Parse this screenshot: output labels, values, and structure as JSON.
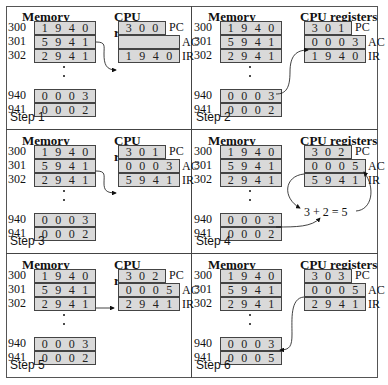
{
  "headers": {
    "memory": "Memory",
    "cpu": "CPU registers"
  },
  "register_labels": {
    "pc": "PC",
    "ac": "AC",
    "ir": "IR"
  },
  "addresses": [
    "300",
    "301",
    "302",
    "940",
    "941"
  ],
  "steps": [
    {
      "label": "Step 1",
      "memory": [
        "1 9 4 0",
        "5 9 4 1",
        "2 9 4 1",
        "0 0 0 3",
        "0 0 0 2"
      ],
      "pc": "3 0 0",
      "ac": "",
      "ir": "1 9 4 0"
    },
    {
      "label": "Step 2",
      "memory": [
        "1 9 4 0",
        "5 9 4 1",
        "2 9 4 1",
        "0 0 0 3",
        "0 0 0 2"
      ],
      "pc": "3 0 1",
      "ac": "0 0 0 3",
      "ir": "1 9 4 0"
    },
    {
      "label": "Step 3",
      "memory": [
        "1 9 4 0",
        "5 9 4 1",
        "2 9 4 1",
        "0 0 0 3",
        "0 0 0 2"
      ],
      "pc": "3 0 1",
      "ac": "0 0 0 3",
      "ir": "5 9 4 1"
    },
    {
      "label": "Step 4",
      "memory": [
        "1 9 4 0",
        "5 9 4 1",
        "2 9 4 1",
        "0 0 0 3",
        "0 0 0 2"
      ],
      "pc": "3 0 2",
      "ac": "0 0 0 5",
      "ir": "5 9 4 1",
      "annotation": "3 + 2 = 5"
    },
    {
      "label": "Step 5",
      "memory": [
        "1 9 4 0",
        "5 9 4 1",
        "2 9 4 1",
        "0 0 0 3",
        "0 0 0 2"
      ],
      "pc": "3 0 2",
      "ac": "0 0 0 5",
      "ir": "2 9 4 1"
    },
    {
      "label": "Step 6",
      "memory": [
        "1 9 4 0",
        "5 9 4 1",
        "2 9 4 1",
        "0 0 0 3",
        "0 0 0 5"
      ],
      "pc": "3 0 3",
      "ac": "0 0 0 5",
      "ir": "2 9 4 1"
    }
  ]
}
